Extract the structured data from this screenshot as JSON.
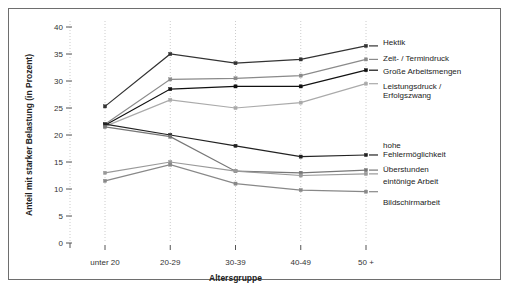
{
  "chart_data": {
    "type": "line",
    "title": "",
    "xlabel": "Altersgruppe",
    "ylabel": "Anteil mit starker Belastung (in Prozent)",
    "categories": [
      "unter 20",
      "20-29",
      "30-39",
      "40-49",
      "50 +"
    ],
    "ylim": [
      0,
      40
    ],
    "yticks": [
      0,
      5,
      10,
      15,
      20,
      25,
      30,
      35,
      40
    ],
    "ytick_labels": [
      "0",
      "5",
      "10",
      "15",
      "20",
      "25",
      "30",
      "35",
      "40"
    ],
    "grid": "vertical-dotted",
    "legend_position": "right",
    "series": [
      {
        "name": "Hektik",
        "values": [
          25.3,
          35.0,
          33.3,
          34.0,
          36.5
        ],
        "color": "#333333"
      },
      {
        "name": "Zeit- / Termindruck",
        "values": [
          22.0,
          30.3,
          30.5,
          31.0,
          34.0
        ],
        "color": "#8a8a8a"
      },
      {
        "name": "Große Arbeitsmengen",
        "values": [
          21.8,
          28.5,
          29.0,
          29.0,
          32.0
        ],
        "color": "#111111"
      },
      {
        "name": "Leistungsdruck / Erfolgszwang",
        "values": [
          21.6,
          26.5,
          25.0,
          26.0,
          29.5
        ],
        "color": "#aaaaaa"
      },
      {
        "name": "hohe Fehlermöglichkeit",
        "values": [
          22.0,
          20.0,
          18.0,
          16.0,
          16.3
        ],
        "color": "#222222"
      },
      {
        "name": "Überstunden",
        "values": [
          21.5,
          19.7,
          13.3,
          13.0,
          13.5
        ],
        "color": "#777777"
      },
      {
        "name": "eintönige Arbeit",
        "values": [
          13.0,
          15.0,
          13.3,
          12.5,
          12.8
        ],
        "color": "#999999"
      },
      {
        "name": "Bildschirmarbeit",
        "values": [
          11.5,
          14.5,
          11.0,
          9.8,
          9.5
        ],
        "color": "#888888"
      }
    ],
    "legend_entries": [
      {
        "label": "Hektik",
        "lines": [
          "Hektik"
        ],
        "color": "#333333"
      },
      {
        "label": "Zeit- / Termindruck",
        "lines": [
          "Zeit- / Termindruck"
        ],
        "color": "#8a8a8a"
      },
      {
        "label": "Große Arbeitsmengen",
        "lines": [
          "Große Arbeitsmengen"
        ],
        "color": "#111111"
      },
      {
        "label": "Leistungsdruck / Erfolgszwang",
        "lines": [
          "Leistungsdruck /",
          "Erfolgszwang"
        ],
        "color": "#aaaaaa"
      },
      {
        "label": "hohe Fehlermöglichkeit",
        "lines": [
          "hohe",
          "Fehlermöglichkeit"
        ],
        "color": "#222222"
      },
      {
        "label": "Überstunden",
        "lines": [
          "Überstunden"
        ],
        "color": "#777777"
      },
      {
        "label": "eintönige Arbeit",
        "lines": [
          "eintönige Arbeit"
        ],
        "color": "#999999"
      },
      {
        "label": "Bildschirmarbeit",
        "lines": [
          "Bildschirmarbeit"
        ],
        "color": "#888888"
      }
    ]
  }
}
